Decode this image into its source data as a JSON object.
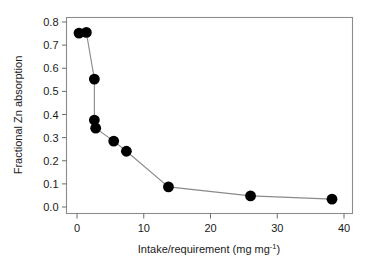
{
  "chart_data": {
    "type": "scatter",
    "title": "",
    "xlabel": "Intake/requirement (mg mg",
    "xlabel_sup": "-1",
    "xlabel_tail": ")",
    "xlabel_full": "Intake/requirement (mg mg⁻¹)",
    "ylabel": "Fractional Zn absorption",
    "xlim": [
      -1.2,
      41.0
    ],
    "ylim": [
      -0.03,
      0.83
    ],
    "xticks": [
      0,
      10,
      20,
      30,
      40
    ],
    "xtick_labels": [
      "0",
      "10",
      "20",
      "30",
      "40"
    ],
    "yticks": [
      0.0,
      0.1,
      0.2,
      0.3,
      0.4,
      0.5,
      0.6,
      0.7,
      0.8
    ],
    "ytick_labels": [
      "0.0",
      "0.1",
      "0.2",
      "0.3",
      "0.4",
      "0.5",
      "0.6",
      "0.7",
      "0.8"
    ],
    "grid": false,
    "legend": false,
    "marker": "filled-circle",
    "marker_color": "#000000",
    "line_color": "#8a8a8a",
    "frame_color": "#8c8c8c",
    "x": [
      0.3,
      1.4,
      2.6,
      2.6,
      2.8,
      5.5,
      7.4,
      13.7,
      26.0,
      38.2
    ],
    "y": [
      0.752,
      0.755,
      0.553,
      0.376,
      0.341,
      0.285,
      0.241,
      0.087,
      0.048,
      0.034
    ],
    "points": [
      {
        "x": 0.3,
        "y": 0.752
      },
      {
        "x": 1.4,
        "y": 0.755
      },
      {
        "x": 2.6,
        "y": 0.553
      },
      {
        "x": 2.6,
        "y": 0.376
      },
      {
        "x": 2.8,
        "y": 0.341
      },
      {
        "x": 5.5,
        "y": 0.285
      },
      {
        "x": 7.4,
        "y": 0.241
      },
      {
        "x": 13.7,
        "y": 0.087
      },
      {
        "x": 26.0,
        "y": 0.048
      },
      {
        "x": 38.2,
        "y": 0.034
      }
    ]
  },
  "axes": {
    "x_axis_name": "intake-requirement-axis",
    "y_axis_name": "fractional-zn-absorption-axis"
  }
}
